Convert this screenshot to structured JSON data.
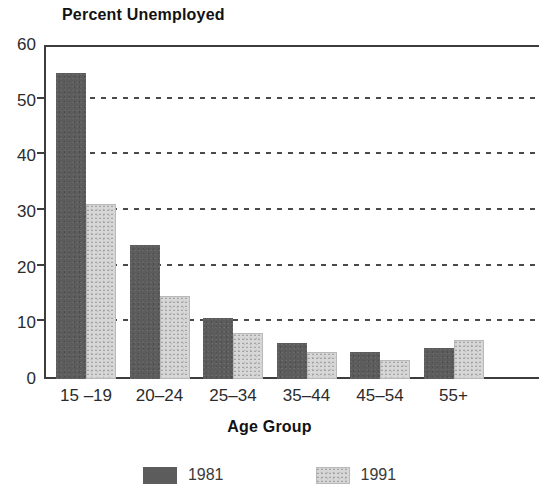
{
  "chart_data": {
    "type": "bar",
    "title": "Percent Unemployed",
    "xlabel": "Age Group",
    "ylabel": "",
    "categories": [
      "15 –19",
      "20–24",
      "25–34",
      "35–44",
      "45–54",
      "55+"
    ],
    "series": [
      {
        "name": "1981",
        "color": "#5c5c5c",
        "values": [
          55,
          24,
          11,
          6.5,
          4.8,
          5.6
        ]
      },
      {
        "name": "1991",
        "color": "#d7d7d7",
        "values": [
          31.5,
          15,
          8.3,
          4.8,
          3.5,
          7
        ]
      }
    ],
    "ylim": [
      0,
      60
    ],
    "yticks": [
      0,
      10,
      20,
      30,
      40,
      50,
      60
    ],
    "ytick_labels": [
      "0",
      "10",
      "20",
      "30",
      "40",
      "50",
      "60"
    ],
    "gridlines": [
      10,
      20,
      30,
      40,
      50
    ],
    "grid": "dotted-horizontal",
    "legend_position": "bottom-center"
  }
}
